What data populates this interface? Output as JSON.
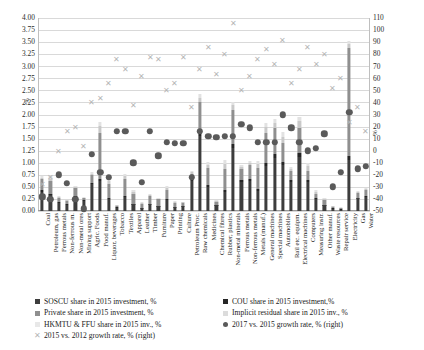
{
  "chart_data": {
    "type": "bar",
    "title": "",
    "subtitle": "",
    "xlabel": "",
    "ylabel": "%",
    "y2label": "%",
    "ylim": [
      0,
      4.0
    ],
    "ytick_step": 0.25,
    "y2lim": [
      -50,
      110
    ],
    "y2tick_step": 10,
    "grid": true,
    "legend_position": "bottom",
    "stacked": true,
    "left_ticks": [
      "0.00",
      "0.25",
      "0.50",
      "0.75",
      "1.00",
      "1.25",
      "1.50",
      "1.75",
      "2.00",
      "2.25",
      "2.50",
      "2.75",
      "3.00",
      "3.25",
      "3.50",
      "3.75",
      "4.00"
    ],
    "right_ticks": [
      "-50",
      "-40",
      "-30",
      "-20",
      "-10",
      "0",
      "10",
      "20",
      "30",
      "40",
      "50",
      "60",
      "70",
      "80",
      "90",
      "100",
      "110"
    ],
    "categories": [
      "Coal",
      "Petroleum, gas",
      "Ferrous metals",
      "Non-ferrous m.",
      "Non-metal ores",
      "Mining support",
      "Agric. Foods",
      "Food manuf.",
      "Liquor, beverages",
      "Tobacco",
      "Textiles",
      "Apparel",
      "Leather",
      "Timber",
      "Furniture",
      "Paper",
      "Printing",
      "Culture",
      "Petroleum Proc.",
      "Raw chemicals",
      "Medicines",
      "Chemical fibres",
      "Rubber, plastics",
      "Non-metal minerals",
      "Ferrous metals",
      "Non-ferrous metals",
      "Metals (manuf.)",
      "General machines",
      "Special machines",
      "Automobiles",
      "Rail etc. equipm.",
      "Electrical machines",
      "Computers",
      "Measuring instr.",
      "Other manuf.",
      "Waste resources",
      "Repair service",
      "Electricity",
      "Gas",
      "Water"
    ],
    "series": [
      {
        "name": "SOSCU share in 2015 investment, %",
        "key": "soscu",
        "color": "#3d3d3d",
        "axis": "left",
        "type": "bar-segment",
        "values": [
          0.4,
          0.33,
          0.16,
          0.13,
          0.3,
          0.2,
          0.55,
          0.62,
          0.24,
          0.07,
          0.3,
          0.14,
          0.06,
          0.14,
          0.1,
          0.22,
          0.08,
          0.1,
          0.62,
          1.55,
          0.5,
          0.12,
          0.4,
          1.3,
          0.6,
          0.62,
          0.42,
          0.93,
          1.1,
          0.95,
          0.6,
          1.12,
          0.6,
          0.24,
          0.12,
          0.05,
          0.03,
          1.05,
          0.26,
          0.3
        ]
      },
      {
        "name": "COU share in 2015 investment,%",
        "key": "cou",
        "color": "#262626",
        "axis": "left",
        "type": "bar-segment",
        "values": [
          0.04,
          0.03,
          0.02,
          0.01,
          0.02,
          0.02,
          0.04,
          0.05,
          0.02,
          0.01,
          0.02,
          0.01,
          0.01,
          0.01,
          0.01,
          0.02,
          0.01,
          0.01,
          0.05,
          0.1,
          0.04,
          0.01,
          0.03,
          0.09,
          0.05,
          0.05,
          0.03,
          0.07,
          0.08,
          0.07,
          0.05,
          0.08,
          0.05,
          0.02,
          0.01,
          0.01,
          0.01,
          0.08,
          0.02,
          0.02
        ]
      },
      {
        "name": "Private share in 2015 investment, %",
        "key": "private",
        "color": "#8f8f8f",
        "axis": "left",
        "type": "bar-segment",
        "values": [
          0.22,
          0.27,
          0.1,
          0.07,
          0.16,
          0.05,
          0.15,
          0.95,
          0.3,
          0.03,
          0.35,
          0.2,
          0.08,
          0.16,
          0.13,
          0.2,
          0.08,
          0.06,
          0.1,
          0.6,
          0.35,
          0.06,
          0.45,
          0.7,
          0.22,
          0.28,
          0.45,
          0.62,
          0.55,
          0.38,
          0.18,
          0.52,
          0.18,
          0.1,
          0.1,
          0.03,
          0.02,
          2.25,
          0.1,
          0.12
        ]
      },
      {
        "name": "HKMTU & FFU share in 2015 inv., %",
        "key": "hkmtu",
        "color": "#c9c9c9",
        "axis": "left",
        "type": "bar-segment",
        "values": [
          0.02,
          0.04,
          0.02,
          0.01,
          0.02,
          0.01,
          0.03,
          0.14,
          0.06,
          0.01,
          0.06,
          0.05,
          0.02,
          0.02,
          0.02,
          0.04,
          0.02,
          0.01,
          0.04,
          0.1,
          0.07,
          0.02,
          0.1,
          0.1,
          0.05,
          0.05,
          0.08,
          0.12,
          0.1,
          0.14,
          0.04,
          0.14,
          0.1,
          0.04,
          0.02,
          0.01,
          0.01,
          0.08,
          0.02,
          0.02
        ]
      },
      {
        "name": "Implicit residual share in 2015 inv., %",
        "key": "residual",
        "color": "#e2e2e2",
        "axis": "left",
        "type": "bar-segment",
        "values": [
          0.04,
          0.05,
          0.02,
          0.01,
          0.02,
          0.01,
          0.03,
          0.08,
          0.04,
          0.01,
          0.04,
          0.03,
          0.02,
          0.02,
          0.02,
          0.03,
          0.02,
          0.01,
          0.03,
          0.08,
          0.05,
          0.02,
          0.07,
          0.08,
          0.04,
          0.04,
          0.06,
          0.09,
          0.08,
          0.09,
          0.04,
          0.09,
          0.07,
          0.03,
          0.02,
          0.01,
          0.01,
          0.06,
          0.02,
          0.02
        ]
      },
      {
        "name": "2017 vs. 2015 growth rate, % (right)",
        "key": "growth_2017_2015",
        "color": "#5a5a5a",
        "axis": "right",
        "type": "scatter-dot",
        "values": [
          -38,
          -40,
          -20,
          -27,
          -40,
          -48,
          -3,
          -18,
          -22,
          16,
          16,
          -10,
          -26,
          16,
          -4,
          7,
          6,
          6,
          -22,
          16,
          12,
          11,
          12,
          12,
          22,
          19,
          7,
          7,
          7,
          30,
          19,
          7,
          0,
          2,
          14,
          -30,
          -18,
          32,
          -15,
          -13
        ]
      },
      {
        "name": "2015 vs. 2012 growth rate, % (right)",
        "key": "growth_2015_2012",
        "color": "#b5b5b5",
        "axis": "right",
        "type": "scatter-cross",
        "values": [
          -28,
          -22,
          0,
          16,
          20,
          4,
          40,
          44,
          56,
          76,
          68,
          38,
          62,
          78,
          76,
          50,
          56,
          78,
          36,
          68,
          86,
          64,
          80,
          106,
          50,
          62,
          76,
          84,
          72,
          92,
          56,
          68,
          86,
          72,
          80,
          52,
          60,
          24,
          36,
          16
        ]
      }
    ],
    "legend": {
      "left_column": [
        {
          "label": "SOSCU share in 2015 investment, %",
          "marker": "square",
          "color": "#3d3d3d"
        },
        {
          "label": "Private share in 2015 investment, %",
          "marker": "square",
          "color": "#8f8f8f"
        },
        {
          "label": "HKMTU & FFU share in 2015 inv., %",
          "marker": "square-light",
          "color": "#e8e8e8"
        },
        {
          "label": "2015 vs. 2012 growth rate, % (right)",
          "marker": "cross",
          "color": "#b5b5b5"
        }
      ],
      "right_column": [
        {
          "label": "COU share in 2015 investment,%",
          "marker": "square",
          "color": "#262626"
        },
        {
          "label": "Implicit residual share in 2015 inv., %",
          "marker": "square-light",
          "color": "#dcdcdc"
        },
        {
          "label": "2017 vs. 2015 growth rate, % (right)",
          "marker": "dot",
          "color": "#5a5a5a"
        }
      ]
    }
  }
}
